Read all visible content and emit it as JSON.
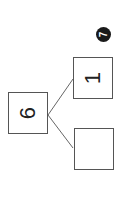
{
  "problem": {
    "number": "7"
  },
  "number_bond": {
    "whole": "6",
    "parts": [
      "1",
      ""
    ]
  },
  "colors": {
    "line": "#555555",
    "badge": "#1a1a1a"
  }
}
